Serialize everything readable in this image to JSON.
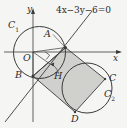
{
  "figure": {
    "title_equation": "4x−3y−6=0",
    "background_color": "#f5f5f3",
    "stroke_color": "#3a3a3a",
    "shade_fill": "#d0d0cd",
    "axes": {
      "x_label": "x",
      "y_label": "y",
      "origin_label": "O",
      "x_axis_y": 52,
      "y_axis_x": 33,
      "x_axis_start": 4,
      "x_axis_end": 122,
      "y_axis_start": 9,
      "y_axis_end": 122
    },
    "circles": [
      {
        "name": "C1",
        "label": "C",
        "label_sub": "1",
        "cx": 39.5,
        "cy": 52.5,
        "r": 26,
        "label_x": 10,
        "label_y": 24
      },
      {
        "name": "C2",
        "label": "C",
        "label_sub": "2",
        "cx": 87,
        "cy": 88,
        "r": 25,
        "label_x": 106,
        "label_y": 93
      }
    ],
    "points": [
      {
        "name": "A",
        "label": "A",
        "x": 65.5,
        "y": 47.5,
        "label_x": 44,
        "label_y": 34
      },
      {
        "name": "B",
        "label": "B",
        "x": 33,
        "y": 76,
        "label_x": 16,
        "label_y": 71
      },
      {
        "name": "H",
        "label": "H",
        "x": 50,
        "y": 64,
        "label_x": 54,
        "label_y": 72
      },
      {
        "name": "C",
        "label": "C",
        "x": 105,
        "y": 79,
        "label_x": 110,
        "label_y": 75
      },
      {
        "name": "D",
        "label": "D",
        "x": 75,
        "y": 112,
        "label_x": 72,
        "label_y": 115
      },
      {
        "name": "O",
        "label": "O",
        "x": 33,
        "y": 52,
        "label_x": 24,
        "label_y": 54
      }
    ],
    "line": {
      "equation": "4x−3y−6=0",
      "x1": 5,
      "y1": 122,
      "x2": 92,
      "y2": 11,
      "eq_label_x": 57,
      "eq_label_y": 7
    },
    "shaded_region": {
      "description": "parallelogram A-B-D-C",
      "vertices": [
        [
          65.5,
          47.5
        ],
        [
          33,
          76
        ],
        [
          75,
          112
        ],
        [
          105,
          79
        ]
      ]
    },
    "right_angle_marker": {
      "x": 45,
      "y": 55,
      "size": 6
    },
    "leader_lines": [
      {
        "name": "A-leader",
        "x1": 53,
        "y1": 35,
        "x2": 64,
        "y2": 46
      },
      {
        "name": "H-arrow",
        "x1": 58,
        "y1": 72,
        "x2": 51,
        "y2": 65
      }
    ]
  }
}
